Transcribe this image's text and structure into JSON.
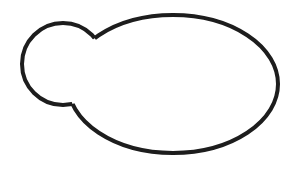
{
  "document": {
    "kind": "line-drawing",
    "title": "Two overlapping outlined shapes",
    "width": 294,
    "height": 170,
    "background_color": "#ffffff"
  },
  "style": {
    "stroke_color": "#1d1d1d",
    "stroke_width": 4,
    "fill": "none",
    "stroke_linecap": "round",
    "stroke_linejoin": "round"
  },
  "shapes": [
    {
      "id": "small-circle",
      "name": "small-circle",
      "type": "circle",
      "center_x": 63,
      "center_y": 64,
      "radius": 41,
      "bounds": {
        "left": 22,
        "top": 23,
        "right": 104,
        "bottom": 105
      },
      "position": "left",
      "relative_size": "small"
    },
    {
      "id": "large-ellipse",
      "name": "large-ellipse",
      "type": "ellipse",
      "center_x": 173,
      "center_y": 84,
      "radius_x": 105,
      "radius_y": 69,
      "bounds": {
        "left": 68,
        "top": 15,
        "right": 278,
        "bottom": 153
      },
      "position": "right",
      "relative_size": "large"
    }
  ],
  "intersection": {
    "name": "overlap-region",
    "description": "Outlines merge; the arc of the large ellipse inside the small circle is not drawn",
    "upper_junction_x": 97,
    "upper_junction_y": 37,
    "lower_junction_x": 85,
    "lower_junction_y": 100,
    "render_mode": "union-outline"
  },
  "labels": {
    "figure_caption": "",
    "annotations": []
  }
}
